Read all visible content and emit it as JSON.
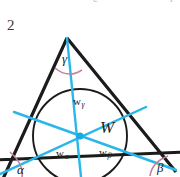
{
  "page": {
    "number": "2",
    "background": "#ffffff",
    "width": 180,
    "height": 177,
    "clipped_top_marks": [
      "'",
      "c",
      "r"
    ]
  },
  "figure": {
    "type": "geometry-diagram",
    "colors": {
      "triangle_stroke": "#1b1b1b",
      "incircle_stroke": "#1b1b1b",
      "bisector": "#29b6e8",
      "incenter_point": "#17a9e0",
      "angle_arc": "#c77f9c",
      "label_text": "#232323"
    },
    "geometry": {
      "vertex_apex": [
        67,
        38
      ],
      "vertex_left": [
        2,
        181
      ],
      "vertex_right": [
        176,
        172
      ],
      "incenter": [
        80,
        136
      ],
      "incircle_radius": 47
    },
    "labels": {
      "angle_alpha": "α",
      "angle_beta": "β",
      "angle_gamma": "γ",
      "incenter": "W",
      "bisector_alpha": "w",
      "bisector_alpha_sub": "α",
      "bisector_beta": "w",
      "bisector_beta_sub": "β",
      "bisector_gamma": "w",
      "bisector_gamma_sub": "γ"
    }
  }
}
